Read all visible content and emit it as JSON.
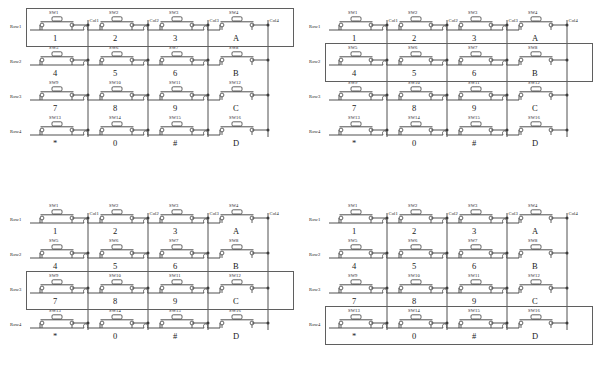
{
  "diagram": {
    "type": "schematic",
    "row_labels": [
      "Row1",
      "Row2",
      "Row3",
      "Row4"
    ],
    "col_labels": [
      "Col1",
      "Col2",
      "Col3",
      "Col4"
    ],
    "switch_refs": [
      [
        "SW1",
        "SW2",
        "SW3",
        "SW4"
      ],
      [
        "SW5",
        "SW6",
        "SW7",
        "SW8"
      ],
      [
        "SW9",
        "SW10",
        "SW11",
        "SW12"
      ],
      [
        "SW13",
        "SW14",
        "SW15",
        "SW16"
      ]
    ],
    "key_labels": [
      [
        "1",
        "2",
        "3",
        "A"
      ],
      [
        "4",
        "5",
        "6",
        "B"
      ],
      [
        "7",
        "8",
        "9",
        "C"
      ],
      [
        "*",
        "0",
        "#",
        "D"
      ]
    ],
    "wire_color": "#3d3d3d",
    "highlight_color": "#5f5f5f",
    "background": "#ffffff"
  },
  "panels": [
    {
      "id": "panel-top-left",
      "position": "top-left",
      "highlighted_row_index": 0,
      "highlighted_row_label": "Row1",
      "highlighted_keys": [
        "1",
        "2",
        "3",
        "A"
      ]
    },
    {
      "id": "panel-top-right",
      "position": "top-right",
      "highlighted_row_index": 1,
      "highlighted_row_label": "Row2",
      "highlighted_keys": [
        "4",
        "5",
        "6",
        "B"
      ]
    },
    {
      "id": "panel-bottom-left",
      "position": "bottom-left",
      "highlighted_row_index": 2,
      "highlighted_row_label": "Row3",
      "highlighted_keys": [
        "7",
        "8",
        "9",
        "C"
      ]
    },
    {
      "id": "panel-bottom-right",
      "position": "bottom-right",
      "highlighted_row_index": 3,
      "highlighted_row_label": "Row4",
      "highlighted_keys": [
        "*",
        "0",
        "#",
        "D"
      ]
    }
  ]
}
